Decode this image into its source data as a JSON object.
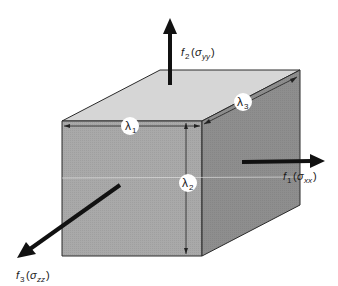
{
  "diagram": {
    "type": "stress-cube",
    "colors": {
      "top_face": "#d6d6d6",
      "front_face": "#a9a9a9",
      "right_face": "#8e8e8e",
      "edge": "#2a2a2a",
      "arrow": "#111111",
      "label_badge": "#ffffff"
    },
    "forces": [
      {
        "id": "f2",
        "symbol": "f",
        "sub": "2",
        "stress": "σ",
        "stress_sub": "yy",
        "direction": "up"
      },
      {
        "id": "f1",
        "symbol": "f",
        "sub": "1",
        "stress": "σ",
        "stress_sub": "xx",
        "direction": "right"
      },
      {
        "id": "f3",
        "symbol": "f",
        "sub": "3",
        "stress": "σ",
        "stress_sub": "zz",
        "direction": "down-left"
      }
    ],
    "dimensions": [
      {
        "id": "lambda1",
        "symbol": "λ",
        "sub": "1",
        "axis": "width"
      },
      {
        "id": "lambda2",
        "symbol": "λ",
        "sub": "2",
        "axis": "height"
      },
      {
        "id": "lambda3",
        "symbol": "λ",
        "sub": "3",
        "axis": "depth"
      }
    ]
  }
}
